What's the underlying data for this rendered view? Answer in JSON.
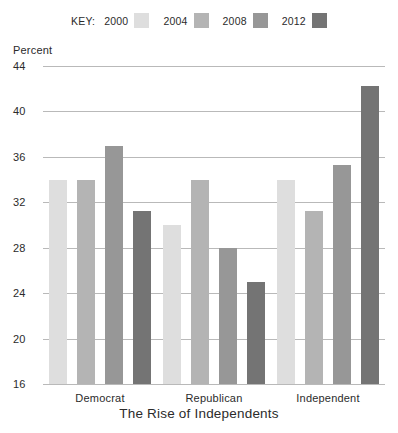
{
  "chart_data": {
    "type": "bar",
    "title": "The Rise of Independents",
    "xlabel": "",
    "ylabel": "Percent",
    "ylim": [
      16,
      44
    ],
    "yticks": [
      16,
      20,
      24,
      28,
      32,
      36,
      40,
      44
    ],
    "grid": true,
    "legend_position": "top-center",
    "legend_title": "KEY:",
    "categories": [
      "Democrat",
      "Republican",
      "Independent"
    ],
    "series": [
      {
        "name": "2000",
        "color": "#dedede",
        "values": [
          34,
          30,
          34
        ]
      },
      {
        "name": "2004",
        "color": "#b4b4b4",
        "values": [
          34,
          34,
          31.2
        ]
      },
      {
        "name": "2008",
        "color": "#979797",
        "values": [
          37,
          28,
          35.3
        ]
      },
      {
        "name": "2012",
        "color": "#747474",
        "values": [
          31.2,
          25,
          42.2
        ]
      }
    ]
  }
}
